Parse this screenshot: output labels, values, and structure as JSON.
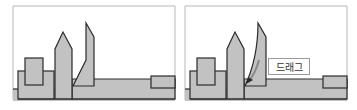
{
  "diagram": {
    "panels": [
      {
        "name": "before",
        "description": "Shapes before dragging the leaning piece"
      },
      {
        "name": "after",
        "description": "Leaning piece bent/curved by dragging"
      }
    ],
    "drag_label": "드래그",
    "colors": {
      "fill": "#c2c2c2",
      "stroke": "#2a2a2a",
      "frame": "#b0b0b0",
      "arrow": "#8a8a8a",
      "background": "#ffffff"
    }
  }
}
